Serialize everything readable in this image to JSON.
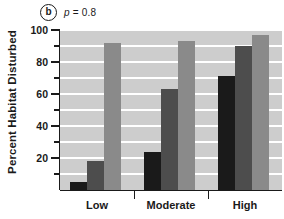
{
  "panel": {
    "letter": "b",
    "annotation_symbol": "p",
    "annotation_rest": " = 0.8"
  },
  "chart_data": {
    "type": "bar",
    "title": "",
    "subtitle": "",
    "xlabel": "",
    "ylabel": "Percent Habitat Disturbed",
    "categories": [
      "Low",
      "Moderate",
      "High"
    ],
    "series": [
      {
        "name": "series-1",
        "color": "#1a1a1a",
        "values": [
          5,
          24,
          71
        ]
      },
      {
        "name": "series-2",
        "color": "#4d4d4d",
        "values": [
          18,
          63,
          90
        ]
      },
      {
        "name": "series-3",
        "color": "#8a8a8a",
        "values": [
          92,
          93,
          97
        ]
      }
    ],
    "ylim": [
      0,
      100
    ],
    "ytick_major": [
      20,
      40,
      60,
      80,
      100
    ],
    "ytick_minor": [
      10,
      30,
      50,
      70,
      90
    ],
    "ytick_labels": [
      "20",
      "40",
      "60",
      "80",
      "100"
    ],
    "gridlines": [
      10,
      20,
      30,
      40,
      50,
      60,
      70,
      80,
      90,
      100
    ],
    "grid": true,
    "grid_color": "#ffffff",
    "plot_background": "#cdcdcd",
    "legend": "none",
    "annotations": [
      "b",
      "p = 0.8"
    ]
  }
}
